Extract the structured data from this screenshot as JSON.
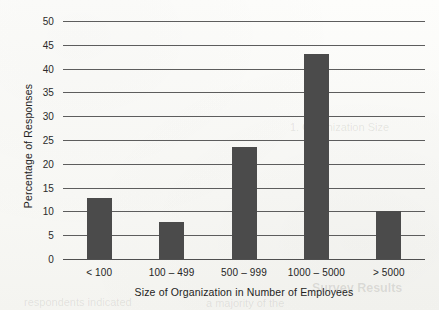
{
  "chart_data": {
    "type": "bar",
    "title": "",
    "xlabel": "Size of Organization in Number of Employees",
    "ylabel": "Percentage of Responses",
    "categories": [
      "< 100",
      "100 – 499",
      "500 – 999",
      "1000 – 5000",
      "> 5000"
    ],
    "values": [
      12.9,
      7.8,
      23.5,
      43.1,
      10.1
    ],
    "ylim": [
      0,
      50
    ],
    "ytick_labels": [
      "0",
      "5",
      "10",
      "15",
      "20",
      "25",
      "30",
      "35",
      "40",
      "45",
      "50"
    ],
    "ytick_values": [
      0,
      5,
      10,
      15,
      20,
      25,
      30,
      35,
      40,
      45,
      50
    ],
    "grid": "horizontal",
    "legend": "none",
    "bar_color": "#4b4b4b",
    "axis_color": "#5d5d5d",
    "background_color": "#fbfbf9"
  },
  "artifacts": {
    "ghost_texts": [
      "Survey Results",
      "1. Organization Size",
      "respondents indicated",
      "a majority of the"
    ]
  }
}
